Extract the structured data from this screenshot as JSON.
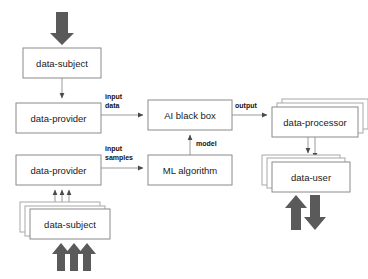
{
  "diagram": {
    "background_color": "#ffffff",
    "box_stroke_color": "#8a8a8a",
    "line_color": "#9a9a9a",
    "thick_arrow_color": "#5a5a5a",
    "text_color": "#1a1a1a"
  },
  "nodes": {
    "data_subject_top": {
      "label": "data-subject",
      "stacked": false,
      "x": 23,
      "y": 48,
      "w": 78,
      "h": 30
    },
    "data_provider_top": {
      "label": "data-provider",
      "stacked": false,
      "x": 16,
      "y": 103,
      "w": 85,
      "h": 30
    },
    "data_provider_bottom": {
      "label": "data-provider",
      "stacked": false,
      "x": 16,
      "y": 155,
      "w": 85,
      "h": 30
    },
    "data_subject_bottom": {
      "label": "data-subject",
      "stacked": true,
      "x": 30,
      "y": 209,
      "w": 80,
      "h": 30
    },
    "ai_black_box": {
      "label": "AI black box",
      "stacked": false,
      "x": 148,
      "y": 100,
      "w": 84,
      "h": 30
    },
    "ml_algorithm": {
      "label": "ML algorithm",
      "stacked": false,
      "x": 148,
      "y": 155,
      "w": 84,
      "h": 30
    },
    "data_processor": {
      "label": "data-processor",
      "stacked": true,
      "x": 272,
      "y": 107,
      "w": 86,
      "h": 30
    },
    "data_user": {
      "label": "data-user",
      "stacked": true,
      "x": 272,
      "y": 162,
      "w": 78,
      "h": 30
    }
  },
  "edge_labels": {
    "input_data": {
      "line1": "input",
      "line2": "data",
      "x": 105,
      "y": 97
    },
    "input_samples": {
      "line1": "input",
      "line2": "samples",
      "x": 105,
      "y": 149
    },
    "output": {
      "line1": "output",
      "line2": "",
      "x": 235,
      "y": 106
    },
    "model": {
      "line1": "model",
      "line2": "",
      "x": 198,
      "y": 143
    }
  },
  "thick_arrows": [
    {
      "name": "top-input-arrow",
      "direction": "down",
      "x": 62,
      "y": 12,
      "length": 32
    },
    {
      "name": "subject-stack-arrow-1",
      "direction": "up",
      "x": 60,
      "y": 243,
      "length": 28
    },
    {
      "name": "subject-stack-arrow-2",
      "direction": "up",
      "x": 72,
      "y": 243,
      "length": 28
    },
    {
      "name": "subject-stack-arrow-3",
      "direction": "up",
      "x": 84,
      "y": 243,
      "length": 28
    },
    {
      "name": "data-user-arrow-up",
      "direction": "up",
      "x": 296,
      "y": 196,
      "length": 30
    },
    {
      "name": "data-user-arrow-down",
      "direction": "down",
      "x": 314,
      "y": 196,
      "length": 30
    }
  ],
  "thin_arrows": [
    {
      "name": "subject-to-provider",
      "from": "data-subject",
      "to": "data-provider"
    },
    {
      "name": "provider-to-ai-blackbox",
      "from": "data-provider",
      "to": "AI black box",
      "label": "input data"
    },
    {
      "name": "provider-to-ml-algorithm",
      "from": "data-provider",
      "to": "ML algorithm",
      "label": "input samples"
    },
    {
      "name": "ml-algorithm-to-ai-blackbox",
      "from": "ML algorithm",
      "to": "AI black box",
      "label": "model"
    },
    {
      "name": "ai-blackbox-to-processor",
      "from": "AI black box",
      "to": "data-processor",
      "label": "output"
    },
    {
      "name": "processor-to-user-1",
      "from": "data-processor",
      "to": "data-user"
    },
    {
      "name": "processor-to-user-2",
      "from": "data-processor",
      "to": "data-user"
    },
    {
      "name": "subject-stack-to-provider-1",
      "from": "data-subject",
      "to": "data-provider"
    },
    {
      "name": "subject-stack-to-provider-2",
      "from": "data-subject",
      "to": "data-provider"
    },
    {
      "name": "subject-stack-to-provider-3",
      "from": "data-subject",
      "to": "data-provider"
    }
  ]
}
